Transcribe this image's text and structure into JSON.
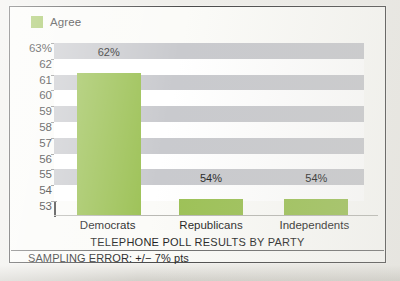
{
  "legend": {
    "position": "top-left",
    "entries": [
      {
        "label": "Agree",
        "color": "#9cc155",
        "swatch_name": "legend-swatch-agree"
      }
    ]
  },
  "axis": {
    "y_top_label": "63%",
    "y_tick_labels": [
      "63%",
      "62",
      "61",
      "60",
      "59",
      "58",
      "57",
      "56",
      "55",
      "54",
      "53"
    ],
    "x_tick_labels": [
      "Democrats",
      "Republicans",
      "Independents"
    ]
  },
  "footer": {
    "title": "TELEPHONE POLL RESULTS BY PARTY",
    "sampling_error": "SAMPLING ERROR: +/− 7% pts"
  },
  "bar_labels": [
    "62%",
    "54%",
    "54%"
  ],
  "colors": {
    "bar": "#9cc155",
    "band": "#c9cace",
    "band_alt": "#ffffff",
    "axis": "#3a3a3a",
    "frame": "#4a4a4a",
    "paper": "#fbfbf8",
    "text": "#1f1f1f"
  },
  "chart_data": {
    "type": "bar",
    "title": "TELEPHONE POLL RESULTS BY PARTY",
    "subtitle": "SAMPLING ERROR: +/− 7% pts",
    "categories": [
      "Democrats",
      "Republicans",
      "Independents"
    ],
    "values": [
      62,
      54,
      54
    ],
    "data_labels": [
      "62%",
      "54%",
      "54%"
    ],
    "series": [
      {
        "name": "Agree",
        "color": "#9cc155",
        "values": [
          62,
          54,
          54
        ]
      }
    ],
    "xlabel": "",
    "ylabel": "",
    "ylim": [
      53,
      63
    ],
    "yticks": [
      53,
      54,
      55,
      56,
      57,
      58,
      59,
      60,
      61,
      62,
      63
    ],
    "ytick_labels": [
      "53",
      "54",
      "55",
      "56",
      "57",
      "58",
      "59",
      "60",
      "61",
      "62",
      "63%"
    ],
    "unit": "percent",
    "grid": "alternating horizontal bands, one per unit",
    "legend_position": "top-left"
  }
}
